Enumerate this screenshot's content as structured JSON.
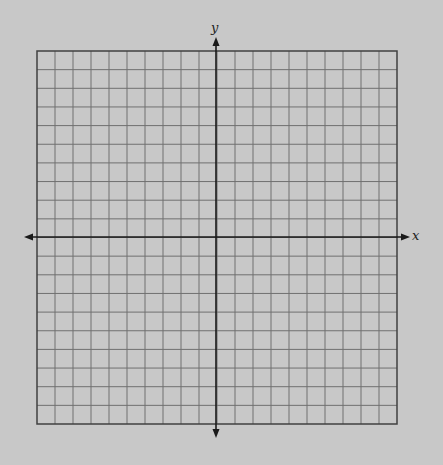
{
  "diagram": {
    "type": "coordinate-plane",
    "grid": {
      "columns": 20,
      "rows": 20,
      "left": 37,
      "top": 51,
      "right": 397,
      "bottom": 424,
      "line_color": "#707070",
      "border_color": "#404040",
      "fill": "#c8c8c8"
    },
    "axes": {
      "origin_x": 216,
      "origin_y": 237,
      "color": "#1a1a1a",
      "x_axis": {
        "label": "x",
        "from": 24,
        "to": 410
      },
      "y_axis": {
        "label": "y",
        "from": 37,
        "to": 438
      }
    }
  }
}
